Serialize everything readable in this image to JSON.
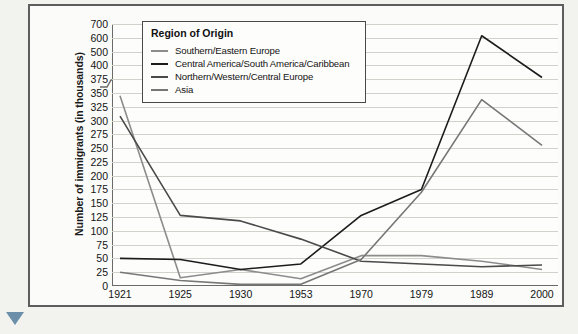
{
  "axis": {
    "y_title": "Number of immigrants (in thousands)",
    "y_ticks": [
      "700",
      "600",
      "500",
      "400",
      "375",
      "350",
      "325",
      "300",
      "275",
      "250",
      "225",
      "200",
      "175",
      "150",
      "125",
      "100",
      "75",
      "50",
      "25",
      "0"
    ],
    "x_ticks": [
      "1921",
      "1925",
      "1930",
      "1953",
      "1970",
      "1979",
      "1989",
      "2000"
    ],
    "break_note": "axis-break-between-400-and-500"
  },
  "legend": {
    "title": "Region of Origin",
    "items": [
      {
        "label": "Southern/Eastern Europe",
        "color": "#8c8c8c"
      },
      {
        "label": "Central America/South America/Caribbean",
        "color": "#1c1c1c"
      },
      {
        "label": "Northern/Western/Central Europe",
        "color": "#4a4a4a"
      },
      {
        "label": "Asia",
        "color": "#777777"
      }
    ]
  },
  "chart_data": {
    "type": "line",
    "title": "",
    "xlabel": "",
    "ylabel": "Number of immigrants (in thousands)",
    "x": [
      "1921",
      "1925",
      "1930",
      "1953",
      "1970",
      "1979",
      "1989",
      "2000"
    ],
    "ylim": [
      0,
      700
    ],
    "grid": true,
    "legend_position": "top-left-inside",
    "y_axis_break": {
      "from": 400,
      "to": 500
    },
    "series": [
      {
        "name": "Southern/Eastern Europe",
        "color": "#8c8c8c",
        "values": [
          345,
          15,
          30,
          13,
          55,
          55,
          45,
          30
        ]
      },
      {
        "name": "Central America/South America/Caribbean",
        "color": "#1c1c1c",
        "values": [
          50,
          48,
          30,
          40,
          128,
          175,
          615,
          378
        ]
      },
      {
        "name": "Northern/Western/Central Europe",
        "color": "#4a4a4a",
        "values": [
          308,
          128,
          118,
          85,
          45,
          40,
          35,
          38
        ]
      },
      {
        "name": "Asia",
        "color": "#777777",
        "values": [
          25,
          10,
          3,
          3,
          48,
          170,
          338,
          255
        ]
      }
    ]
  }
}
